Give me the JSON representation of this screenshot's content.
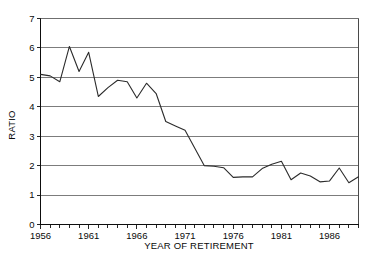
{
  "chart_data": {
    "type": "line",
    "title": "",
    "xlabel": "YEAR OF RETIREMENT",
    "ylabel": "RATIO",
    "xlim": [
      1956,
      1989
    ],
    "ylim": [
      0,
      7
    ],
    "grid": true,
    "legend": null,
    "legend_position": "none",
    "x_tick_labels": [
      "1956",
      "1961",
      "1966",
      "1971",
      "1976",
      "1981",
      "1986"
    ],
    "x_tick_values": [
      1956,
      1961,
      1966,
      1971,
      1976,
      1981,
      1986
    ],
    "x_minor_tick_interval": 1,
    "y_tick_labels": [
      "0",
      "1",
      "2",
      "3",
      "4",
      "5",
      "6",
      "7"
    ],
    "y_tick_values": [
      0,
      1,
      2,
      3,
      4,
      5,
      6,
      7
    ],
    "x": [
      1956,
      1957,
      1958,
      1959,
      1960,
      1961,
      1962,
      1963,
      1964,
      1965,
      1966,
      1967,
      1968,
      1969,
      1970,
      1971,
      1972,
      1973,
      1974,
      1975,
      1976,
      1977,
      1978,
      1979,
      1980,
      1981,
      1982,
      1983,
      1984,
      1985,
      1986,
      1987,
      1988,
      1989
    ],
    "categories": [
      "1956",
      "1957",
      "1958",
      "1959",
      "1960",
      "1961",
      "1962",
      "1963",
      "1964",
      "1965",
      "1966",
      "1967",
      "1968",
      "1969",
      "1970",
      "1971",
      "1972",
      "1973",
      "1974",
      "1975",
      "1976",
      "1977",
      "1978",
      "1979",
      "1980",
      "1981",
      "1982",
      "1983",
      "1984",
      "1985",
      "1986",
      "1987",
      "1988",
      "1989"
    ],
    "series": [
      {
        "name": "Ratio",
        "color": "#2b2b2b",
        "values": [
          5.1,
          5.05,
          4.85,
          6.05,
          5.2,
          5.85,
          4.35,
          4.65,
          4.9,
          4.85,
          4.3,
          4.8,
          4.45,
          3.5,
          3.35,
          3.2,
          2.6,
          2.0,
          1.98,
          1.93,
          1.6,
          1.62,
          1.62,
          1.9,
          2.05,
          2.15,
          1.52,
          1.75,
          1.65,
          1.45,
          1.48,
          1.92,
          1.42,
          1.62
        ]
      }
    ]
  },
  "axes": {
    "y_axis_label": "RATIO",
    "x_axis_label": "YEAR OF RETIREMENT"
  }
}
